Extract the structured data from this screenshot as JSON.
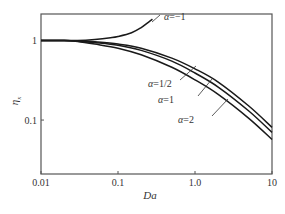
{
  "chart_data": {
    "type": "line",
    "title": "",
    "xlabel": "Da",
    "ylabel": "η_x",
    "xscale": "log",
    "yscale": "log",
    "xlim": [
      0.01,
      10
    ],
    "ylim": [
      0.021,
      2.15
    ],
    "grid": false,
    "legend": "inline annotations",
    "x_ticks": [
      {
        "value": 0.01,
        "label": "0.01"
      },
      {
        "value": 0.1,
        "label": "0.1"
      },
      {
        "value": 1.0,
        "label": "1.0"
      },
      {
        "value": 10,
        "label": "10"
      }
    ],
    "y_ticks": [
      {
        "value": 1,
        "label": "1"
      },
      {
        "value": 0.1,
        "label": "0.1"
      }
    ],
    "series": [
      {
        "name": "α=−1",
        "label_alpha": "α",
        "label_value": "=−1",
        "x": [
          0.01,
          0.02,
          0.03,
          0.05,
          0.08,
          0.1,
          0.15,
          0.2,
          0.25,
          0.28
        ],
        "y": [
          1.0,
          1.0,
          1.0,
          1.03,
          1.08,
          1.12,
          1.25,
          1.45,
          1.7,
          1.85
        ]
      },
      {
        "name": "α=1/2",
        "label_alpha": "α",
        "label_value": "=1/2",
        "x": [
          0.01,
          0.02,
          0.03,
          0.05,
          0.1,
          0.2,
          0.5,
          1.0,
          2.0,
          5.0,
          10
        ],
        "y": [
          1.0,
          1.0,
          0.99,
          0.96,
          0.9,
          0.8,
          0.6,
          0.44,
          0.3,
          0.15,
          0.081
        ]
      },
      {
        "name": "α=1",
        "label_alpha": "α",
        "label_value": "=1",
        "x": [
          0.01,
          0.02,
          0.03,
          0.05,
          0.1,
          0.2,
          0.5,
          1.0,
          2.0,
          5.0,
          10
        ],
        "y": [
          1.0,
          1.0,
          0.98,
          0.94,
          0.87,
          0.75,
          0.55,
          0.39,
          0.26,
          0.13,
          0.07
        ]
      },
      {
        "name": "α=2",
        "label_alpha": "α",
        "label_value": "=2",
        "x": [
          0.01,
          0.02,
          0.03,
          0.05,
          0.1,
          0.2,
          0.5,
          1.0,
          2.0,
          5.0,
          10
        ],
        "y": [
          1.0,
          1.0,
          0.97,
          0.9,
          0.8,
          0.66,
          0.46,
          0.32,
          0.21,
          0.105,
          0.057
        ]
      }
    ],
    "annotations": [
      {
        "series": "α=−1",
        "text": "α=−1"
      },
      {
        "series": "α=1/2",
        "text": "α=1/2"
      },
      {
        "series": "α=1",
        "text": "α=1"
      },
      {
        "series": "α=2",
        "text": "α=2"
      }
    ]
  },
  "axes": {
    "x_title": "Da",
    "y_title_main": "η",
    "y_title_sub": "x"
  }
}
